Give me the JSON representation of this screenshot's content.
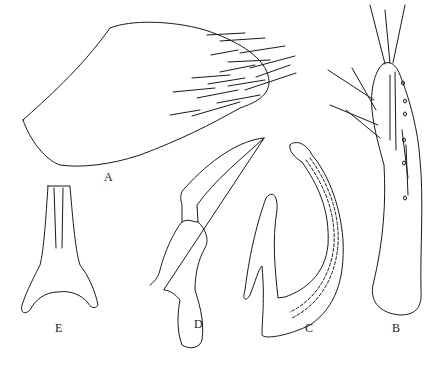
{
  "figure": {
    "type": "morphological line drawing",
    "panels": [
      {
        "id": "A",
        "label": "A",
        "description": "lobe with apical cluster of setae"
      },
      {
        "id": "B",
        "label": "B",
        "description": "elongate appendage with setae on upper half"
      },
      {
        "id": "C",
        "label": "C",
        "description": "curved sclerite with dashed inner duct"
      },
      {
        "id": "D",
        "label": "D",
        "description": "hooked sclerite"
      },
      {
        "id": "E",
        "label": "E",
        "description": "Y-shaped sclerite"
      }
    ],
    "colors": {
      "ink": "#1a1a1a",
      "background": "#ffffff"
    }
  }
}
